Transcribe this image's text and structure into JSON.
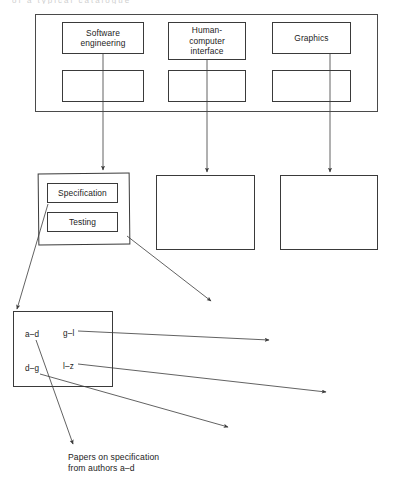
{
  "diagram": {
    "title_fragment": "of a typical catalogue",
    "top_level": {
      "frame_name": "subject-area-frame",
      "categories": [
        {
          "label": "Software\nengineering",
          "x": 62,
          "y": 22,
          "w": 82,
          "h": 32,
          "sub_x": 62,
          "sub_y": 70,
          "sub_w": 82,
          "sub_h": 32
        },
        {
          "label": "Human-\ncomputer\ninterface",
          "x": 168,
          "y": 22,
          "w": 78,
          "h": 38,
          "sub_x": 168,
          "sub_y": 70,
          "sub_w": 78,
          "sub_h": 32
        },
        {
          "label": "Graphics",
          "x": 272,
          "y": 22,
          "w": 79,
          "h": 32,
          "sub_x": 272,
          "sub_y": 70,
          "sub_w": 79,
          "sub_h": 32
        }
      ]
    },
    "mid_level": {
      "boxes": [
        {
          "name": "software-engineering-topics-box",
          "x": 38,
          "y": 173,
          "w": 92,
          "h": 72
        },
        {
          "name": "human-computer-interface-topics-box",
          "x": 156,
          "y": 175,
          "w": 99,
          "h": 75
        },
        {
          "name": "graphics-topics-box",
          "x": 280,
          "y": 175,
          "w": 98,
          "h": 75
        }
      ],
      "topics": [
        {
          "label": "Specification",
          "x": 47,
          "y": 183,
          "w": 71,
          "h": 20
        },
        {
          "label": "Testing",
          "x": 47,
          "y": 212,
          "w": 71,
          "h": 20
        }
      ]
    },
    "author_level": {
      "box": {
        "name": "author-index-box",
        "x": 13,
        "y": 311,
        "w": 100,
        "h": 76
      },
      "ranges": [
        {
          "label": "a–d",
          "x": 25,
          "y": 330
        },
        {
          "label": "g–l",
          "x": 63,
          "y": 329
        },
        {
          "label": "d–g",
          "x": 25,
          "y": 364
        },
        {
          "label": "l–z",
          "x": 63,
          "y": 362
        }
      ]
    },
    "caption": {
      "name": "papers-caption",
      "text": "Papers on specification\nfrom authors a–d",
      "x": 68,
      "y": 452
    },
    "connectors": {
      "vertical_drops": [
        {
          "name": "drop-software-engineering",
          "x1": 103,
          "y1": 54,
          "x2": 103,
          "y2": 170
        },
        {
          "name": "drop-human-computer-interface",
          "x1": 207,
          "y1": 60,
          "x2": 207,
          "y2": 172
        },
        {
          "name": "drop-graphics",
          "x1": 330,
          "y1": 54,
          "x2": 330,
          "y2": 172
        }
      ],
      "diagonals": [
        {
          "name": "link-specification-to-author-index",
          "x1": 48,
          "y1": 204,
          "x2": 17,
          "y2": 309
        },
        {
          "name": "link-testing-to-topic-detail",
          "x1": 127,
          "y1": 236,
          "x2": 211,
          "y2": 301
        },
        {
          "name": "link-gl-to-detail",
          "x1": 78,
          "y1": 331,
          "x2": 271,
          "y2": 340
        },
        {
          "name": "link-lz-to-detail",
          "x1": 78,
          "y1": 364,
          "x2": 328,
          "y2": 392
        },
        {
          "name": "link-dg-to-detail",
          "x1": 40,
          "y1": 374,
          "x2": 230,
          "y2": 427
        },
        {
          "name": "link-ad-to-caption",
          "x1": 36,
          "y1": 340,
          "x2": 73,
          "y2": 446
        }
      ]
    },
    "colors": {
      "stroke": "#3a3a3a",
      "frame_stroke": "#4a4a4a",
      "text": "#232323",
      "background": "#ffffff"
    }
  }
}
